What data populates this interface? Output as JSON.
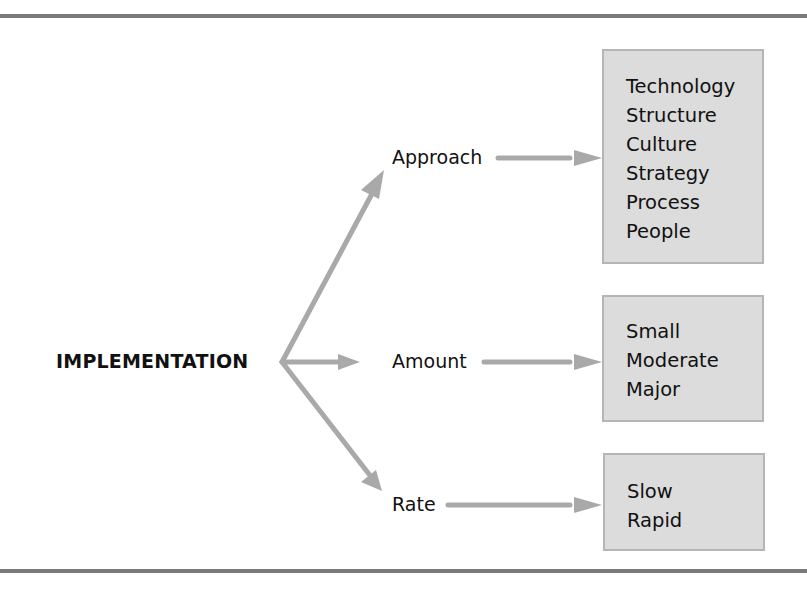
{
  "diagram": {
    "root": {
      "label": "IMPLEMENTATION"
    },
    "branches": [
      {
        "label": "Approach",
        "options": [
          "Technology",
          "Structure",
          "Culture",
          "Strategy",
          "Process",
          "People"
        ]
      },
      {
        "label": "Amount",
        "options": [
          "Small",
          "Moderate",
          "Major"
        ]
      },
      {
        "label": "Rate",
        "options": [
          "Slow",
          "Rapid"
        ]
      }
    ],
    "colors": {
      "arrow": "#a9a9a9",
      "box_fill": "#dcdcdc",
      "box_border": "#b5b5b5",
      "rule": "#7a7a7a"
    }
  }
}
